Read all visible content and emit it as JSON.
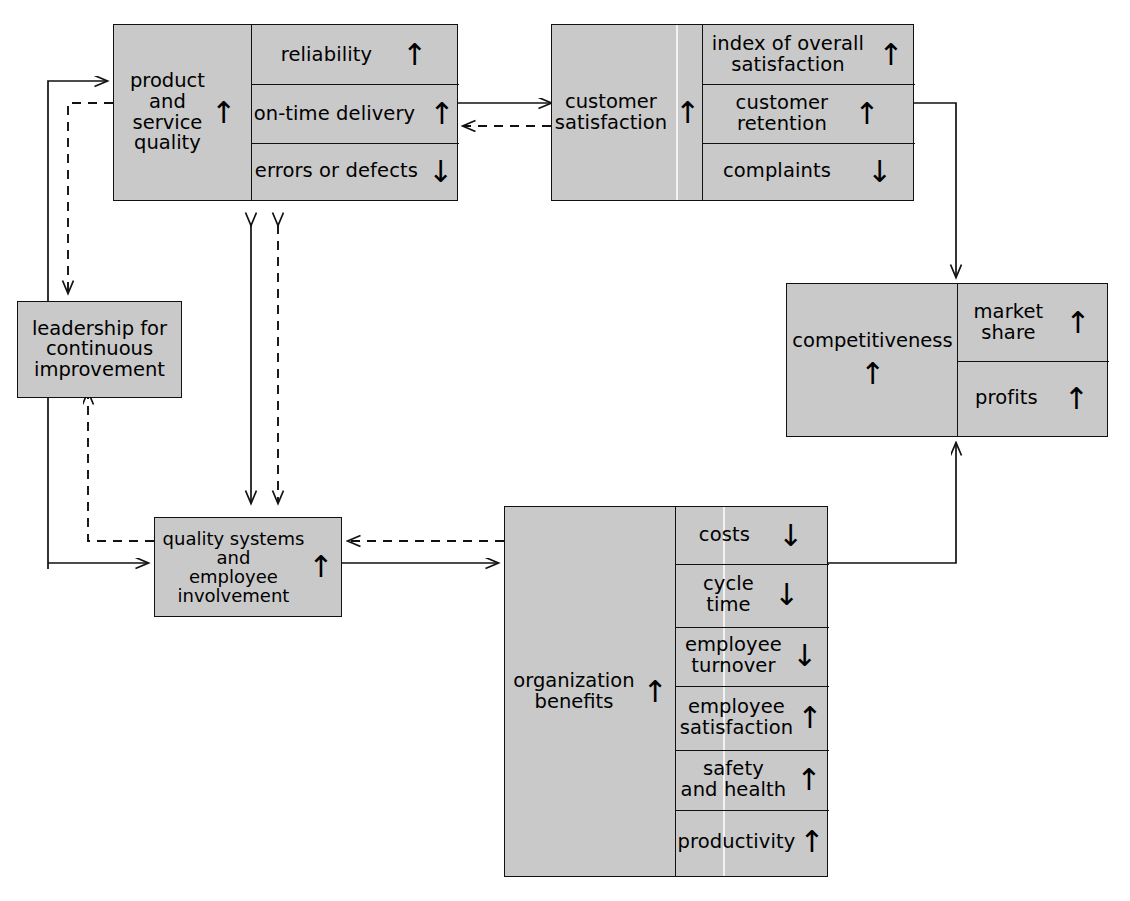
{
  "diagram": {
    "fill_color": "#c9c9c9",
    "line_color": "#111111",
    "arrow_up": "↑",
    "arrow_down": "↓"
  },
  "nodes": {
    "product_quality": {
      "label": "product\nand\nservice\nquality",
      "trend": "↑",
      "metrics": [
        {
          "name": "reliability",
          "trend": "↑"
        },
        {
          "name": "on-time delivery",
          "trend": "↑"
        },
        {
          "name": "errors or defects",
          "trend": "↓"
        }
      ]
    },
    "customer_satisfaction": {
      "label": "customer\nsatisfaction",
      "trend": "↑",
      "metrics": [
        {
          "name": "index of overall\nsatisfaction",
          "trend": "↑"
        },
        {
          "name": "customer\nretention",
          "trend": "↑"
        },
        {
          "name": "complaints",
          "trend": "↓"
        }
      ]
    },
    "competitiveness": {
      "label": "competitiveness",
      "trend": "↑",
      "metrics": [
        {
          "name": "market\nshare",
          "trend": "↑"
        },
        {
          "name": "profits",
          "trend": "↑"
        }
      ]
    },
    "organization_benefits": {
      "label": "organization\nbenefits",
      "trend": "↑",
      "metrics": [
        {
          "name": "costs",
          "trend": "↓"
        },
        {
          "name": "cycle\ntime",
          "trend": "↓"
        },
        {
          "name": "employee\nturnover",
          "trend": "↓"
        },
        {
          "name": "employee\nsatisfaction",
          "trend": "↑"
        },
        {
          "name": "safety\nand health",
          "trend": "↑"
        },
        {
          "name": "productivity",
          "trend": "↑"
        }
      ]
    },
    "leadership": {
      "label": "leadership for\ncontinuous\nimprovement",
      "trend": "",
      "metrics": []
    },
    "quality_systems": {
      "label": "quality systems\nand\nemployee\ninvolvement",
      "trend": "↑",
      "metrics": []
    }
  },
  "connections": [
    {
      "from": "product_quality",
      "to": "customer_satisfaction",
      "style": "solid"
    },
    {
      "from": "customer_satisfaction",
      "to": "product_quality",
      "style": "dashed"
    },
    {
      "from": "customer_satisfaction",
      "to": "competitiveness",
      "style": "solid"
    },
    {
      "from": "organization_benefits",
      "to": "competitiveness",
      "style": "solid"
    },
    {
      "from": "quality_systems",
      "to": "organization_benefits",
      "style": "solid"
    },
    {
      "from": "organization_benefits",
      "to": "quality_systems",
      "style": "dashed"
    },
    {
      "from": "product_quality",
      "to": "quality_systems",
      "style": "solid-double"
    },
    {
      "from": "product_quality",
      "to": "quality_systems",
      "style": "dashed-double"
    },
    {
      "from": "leadership",
      "to": "product_quality",
      "style": "solid"
    },
    {
      "from": "product_quality",
      "to": "leadership",
      "style": "dashed"
    },
    {
      "from": "leadership",
      "to": "quality_systems",
      "style": "solid"
    },
    {
      "from": "quality_systems",
      "to": "leadership",
      "style": "dashed"
    }
  ]
}
